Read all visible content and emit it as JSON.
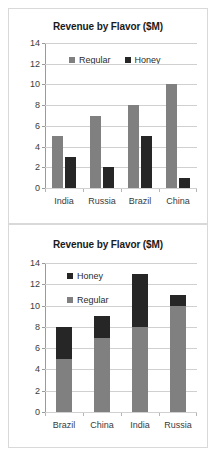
{
  "colors": {
    "regular": "#808080",
    "honey": "#262626",
    "gridline": "#d0d0d0",
    "axis": "#9a9a9a",
    "panel_border": "#d9d9d9",
    "background": "#ffffff",
    "text": "#3b3b3b",
    "title_text": "#1a1a1a"
  },
  "chart_data": [
    {
      "type": "bar",
      "title": "Revenue by Flavor ($M)",
      "xlabel": "",
      "ylabel": "",
      "categories": [
        "India",
        "Russia",
        "Brazil",
        "China"
      ],
      "series": [
        {
          "name": "Regular",
          "color": "#808080",
          "values": [
            5,
            7,
            8,
            10
          ]
        },
        {
          "name": "Honey",
          "color": "#262626",
          "values": [
            3,
            2,
            5,
            1
          ]
        }
      ],
      "ylim": [
        0,
        14
      ],
      "yticks": [
        0,
        2,
        4,
        6,
        8,
        10,
        12,
        14
      ],
      "ytick_labels": [
        "0",
        "2",
        "4",
        "6",
        "8",
        "10",
        "12",
        "14"
      ],
      "grid": true,
      "stacked": false,
      "legend_position": "top-left-inside",
      "legend_orientation": "horizontal"
    },
    {
      "type": "bar",
      "title": "Revenue by Flavor ($M)",
      "xlabel": "",
      "ylabel": "",
      "categories": [
        "Brazil",
        "China",
        "India",
        "Russia"
      ],
      "series": [
        {
          "name": "Honey",
          "color": "#262626",
          "values": [
            3,
            2,
            5,
            1
          ]
        },
        {
          "name": "Regular",
          "color": "#808080",
          "values": [
            5,
            7,
            8,
            10
          ]
        }
      ],
      "totals": [
        8,
        9,
        13,
        11
      ],
      "ylim": [
        0,
        14
      ],
      "yticks": [
        0,
        2,
        4,
        6,
        8,
        10,
        12,
        14
      ],
      "ytick_labels": [
        "0",
        "2",
        "4",
        "6",
        "8",
        "10",
        "12",
        "14"
      ],
      "grid": true,
      "stacked": true,
      "legend_position": "top-left-inside",
      "legend_orientation": "vertical"
    }
  ]
}
